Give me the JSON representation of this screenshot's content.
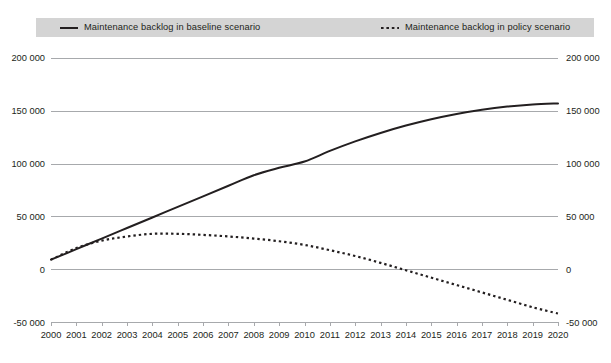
{
  "legend": {
    "entries": [
      {
        "label": "Maintenance backlog in baseline scenario",
        "style": "solid",
        "color": "#231f20",
        "icon": "solid-line-icon"
      },
      {
        "label": "Maintenance backlog in policy scenario",
        "style": "dotted",
        "color": "#231f20",
        "icon": "dotted-line-icon"
      }
    ]
  },
  "axes": {
    "y_left_ticks": [
      "200 000",
      "150 000",
      "100 000",
      "50 000",
      "0",
      "-50 000"
    ],
    "y_right_ticks": [
      "200 000",
      "150 000",
      "100 000",
      "50 000",
      "0",
      "-50 000"
    ],
    "x_ticks": [
      "2000",
      "2001",
      "2002",
      "2003",
      "2004",
      "2005",
      "2006",
      "2007",
      "2008",
      "2009",
      "2010",
      "2011",
      "2012",
      "2013",
      "2014",
      "2015",
      "2016",
      "2017",
      "2018",
      "2019",
      "2020"
    ]
  },
  "colors": {
    "line": "#231f20",
    "grid": "#a7a9ac",
    "legend_background": "#d4d4d4",
    "text": "#231f20",
    "page_background": "#ffffff"
  },
  "chart_data": {
    "type": "line",
    "title": "",
    "subtitle": "",
    "xlabel": "",
    "ylabel": "",
    "xlim": [
      2000,
      2020
    ],
    "ylim": [
      -50000,
      200000
    ],
    "yticks": [
      -50000,
      0,
      50000,
      100000,
      150000,
      200000
    ],
    "grid": true,
    "legend_position": "top",
    "x": [
      2000,
      2001,
      2002,
      2003,
      2004,
      2005,
      2006,
      2007,
      2008,
      2009,
      2010,
      2011,
      2012,
      2013,
      2014,
      2015,
      2016,
      2017,
      2018,
      2019,
      2020
    ],
    "series": [
      {
        "name": "Maintenance backlog in baseline scenario",
        "style": "solid",
        "color": "#231f20",
        "values": [
          9000,
          19000,
          29000,
          39000,
          49000,
          59000,
          69000,
          79000,
          89000,
          96000,
          102000,
          112000,
          121000,
          129000,
          136000,
          142000,
          147000,
          151000,
          154000,
          156000,
          157000
        ]
      },
      {
        "name": "Maintenance backlog in policy scenario",
        "style": "dotted",
        "color": "#231f20",
        "values": [
          9000,
          20000,
          27000,
          31000,
          33500,
          33500,
          32500,
          31000,
          29000,
          26500,
          23000,
          18000,
          12500,
          6000,
          -1000,
          -8000,
          -15000,
          -22000,
          -29000,
          -36000,
          -42000
        ]
      }
    ]
  }
}
